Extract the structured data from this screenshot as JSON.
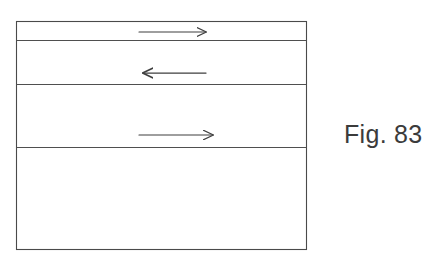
{
  "figure": {
    "caption": "Fig. 83",
    "caption_color": "#3b3b3b",
    "background_color": "#ffffff",
    "line_color": "#4a4a4a",
    "box": {
      "left": 16,
      "top": 21,
      "right": 307,
      "bottom": 250,
      "width": 291,
      "height": 229,
      "border_width": 1
    },
    "divider_lines": [
      {
        "name": "divider-1",
        "y": 40,
        "x1": 16,
        "x2": 307
      },
      {
        "name": "divider-2",
        "y": 84,
        "x1": 16,
        "x2": 307
      },
      {
        "name": "divider-3",
        "y": 147,
        "x1": 16,
        "x2": 307
      }
    ],
    "bands": [
      {
        "name": "band-1",
        "top": 21,
        "bottom": 40,
        "height": 19,
        "arrow": "arrow-right-top"
      },
      {
        "name": "band-2",
        "top": 40,
        "bottom": 84,
        "height": 44,
        "arrow": "arrow-left-middle"
      },
      {
        "name": "band-3",
        "top": 84,
        "bottom": 147,
        "height": 63,
        "arrow": "arrow-right-lower"
      },
      {
        "name": "band-4",
        "top": 147,
        "bottom": 250,
        "height": 103,
        "arrow": null
      }
    ],
    "arrows": [
      {
        "name": "arrow-right-top",
        "direction": "right",
        "y": 32,
        "x_start": 139,
        "x_end": 210,
        "length": 71
      },
      {
        "name": "arrow-left-middle",
        "direction": "left",
        "y": 73,
        "x_start": 206,
        "x_end": 138,
        "length": 68
      },
      {
        "name": "arrow-right-lower",
        "direction": "right",
        "y": 135,
        "x_start": 139,
        "x_end": 217,
        "length": 78
      }
    ]
  }
}
